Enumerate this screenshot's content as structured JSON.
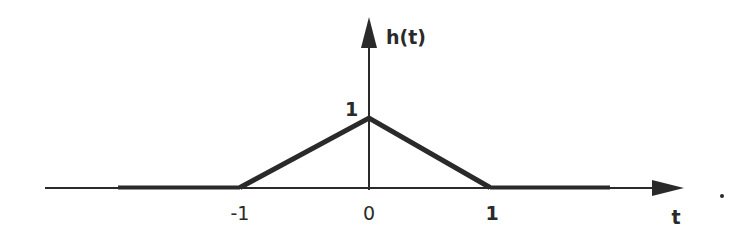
{
  "diagram": {
    "title": "h(t)",
    "x_axis_label": "t",
    "y_axis_label": "h(t)",
    "peak_label": "1",
    "x_ticks": [
      "-1",
      "0",
      "1"
    ],
    "trailing_mark": "."
  },
  "colors": {
    "ink": "#2a2a2a",
    "background": "#ffffff"
  },
  "function": {
    "type": "triangular pulse",
    "points": [
      {
        "t": -1,
        "h": 0
      },
      {
        "t": 0,
        "h": 1
      },
      {
        "t": 1,
        "h": 0
      }
    ]
  }
}
